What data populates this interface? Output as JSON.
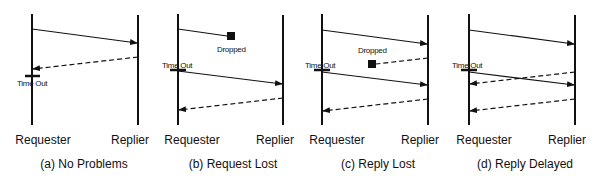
{
  "figure": {
    "panels": [
      {
        "id": "a",
        "caption": "(a) No Problems",
        "requester_label": "Requester",
        "replier_label": "Replier",
        "timeout_label": "Time Out",
        "dropped_label": ""
      },
      {
        "id": "b",
        "caption": "(b) Request Lost",
        "requester_label": "Requester",
        "replier_label": "Replier",
        "timeout_label": "Time Out",
        "dropped_label": "Dropped"
      },
      {
        "id": "c",
        "caption": "(c) Reply Lost",
        "requester_label": "Requester",
        "replier_label": "Replier",
        "timeout_label": "Time Out",
        "dropped_label": "Dropped"
      },
      {
        "id": "d",
        "caption": "(d) Reply Delayed",
        "requester_label": "Requester",
        "replier_label": "Replier",
        "timeout_label": "Time Out",
        "dropped_label": ""
      }
    ],
    "legend": {
      "solid_line": "request message",
      "dashed_line": "reply message",
      "filled_square": "dropped message"
    },
    "colors": {
      "ink": "#111111",
      "background": "#ffffff"
    }
  }
}
